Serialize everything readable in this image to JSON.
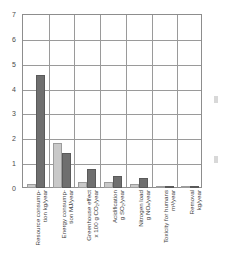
{
  "chart_data": {
    "type": "bar",
    "title": "",
    "xlabel": "",
    "ylabel": "",
    "ylim": [
      0,
      7
    ],
    "grid": true,
    "legend": "none",
    "categories": [
      "Resource consumption kg/year",
      "Energy consumption MJ/year",
      "Greenhouse effect x 100 g CO2/year",
      "Acidification g SO2/year",
      "Nitrogen load g NOx/year",
      "Toxicity for humans m3/year",
      "Removal kg/year"
    ],
    "category_labels": [
      {
        "line1": "Resource consump-",
        "line2": "tion kg/year"
      },
      {
        "line1": "Energy consump-",
        "line2": "tion MJ/year"
      },
      {
        "line1": "Greenhouse effect",
        "line2": "x 100 g CO₂/year"
      },
      {
        "line1": "Acidification",
        "line2": "g SO₂/year"
      },
      {
        "line1": "Nitrogen load",
        "line2": "g NOₓ/year"
      },
      {
        "line1": "Toxicity for humans",
        "line2": "m³/year"
      },
      {
        "line1": "Removal",
        "line2": "kg/year"
      }
    ],
    "series": [
      {
        "name": "series-light",
        "color": "#c9c9c9",
        "values": [
          0.15,
          1.8,
          0.25,
          0.25,
          0.15,
          0.08,
          0.07
        ]
      },
      {
        "name": "series-dark",
        "color": "#6f6f6f",
        "values": [
          4.55,
          1.4,
          0.75,
          0.47,
          0.4,
          0.07,
          0.1
        ]
      }
    ],
    "y_ticks": [
      0,
      1,
      2,
      3,
      4,
      5,
      6,
      7
    ],
    "y_tick_labels": [
      "0",
      "1",
      "2",
      "3",
      "4",
      "5",
      "6",
      "7"
    ]
  },
  "axes": {
    "frame_color": "#8d8d8d",
    "grid_color": "#9a9a9a",
    "tick_text_color": "#4a4a4a",
    "label_text_color": "#3c3c3c"
  }
}
